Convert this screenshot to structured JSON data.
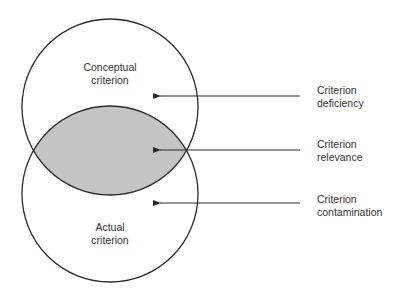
{
  "diagram": {
    "circles": [
      {
        "name": "Conceptual criterion",
        "line1": "Conceptual",
        "line2": "criterion"
      },
      {
        "name": "Actual criterion",
        "line1": "Actual",
        "line2": "criterion"
      }
    ],
    "overlap_fill": "#c4c4c4",
    "stroke_color": "#2a2a2a",
    "annotations": [
      {
        "line1": "Criterion",
        "line2": "deficiency"
      },
      {
        "line1": "Criterion",
        "line2": "relevance"
      },
      {
        "line1": "Criterion",
        "line2": "contamination"
      }
    ]
  }
}
